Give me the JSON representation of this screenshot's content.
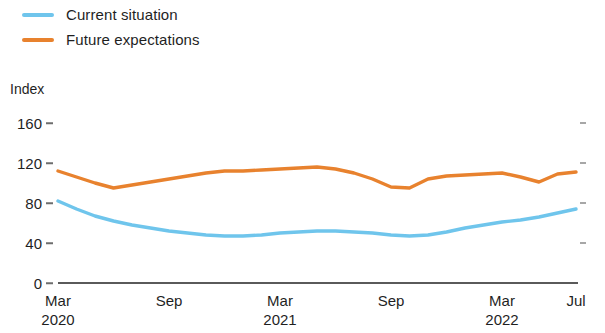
{
  "legend": {
    "position": "top-left",
    "entries": [
      {
        "label": "Current situation",
        "color": "#6FC5EC"
      },
      {
        "label": "Future expectations",
        "color": "#E8822E"
      }
    ]
  },
  "axis_title": "Index",
  "yticks": [
    {
      "label": "0"
    },
    {
      "label": "40"
    },
    {
      "label": "80"
    },
    {
      "label": "120"
    },
    {
      "label": "160"
    }
  ],
  "xticks": [
    {
      "label": "Mar",
      "year": "2020"
    },
    {
      "label": "Sep",
      "year": ""
    },
    {
      "label": "Mar",
      "year": "2021"
    },
    {
      "label": "Sep",
      "year": ""
    },
    {
      "label": "Mar",
      "year": "2022"
    },
    {
      "label": "Jul",
      "year": ""
    }
  ],
  "chart_data": {
    "type": "line",
    "title": "",
    "subtitle": "",
    "xlabel": "",
    "ylabel": "Index",
    "ylim": [
      0,
      160
    ],
    "yticks": [
      0,
      40,
      80,
      120,
      160
    ],
    "grid": false,
    "legend_position": "top-left",
    "x": [
      "Mar 2020",
      "Apr 2020",
      "May 2020",
      "Jun 2020",
      "Jul 2020",
      "Aug 2020",
      "Sep 2020",
      "Oct 2020",
      "Nov 2020",
      "Dec 2020",
      "Jan 2021",
      "Feb 2021",
      "Mar 2021",
      "Apr 2021",
      "May 2021",
      "Jun 2021",
      "Jul 2021",
      "Aug 2021",
      "Sep 2021",
      "Oct 2021",
      "Nov 2021",
      "Dec 2021",
      "Jan 2022",
      "Feb 2022",
      "Mar 2022",
      "Apr 2022",
      "May 2022",
      "Jun 2022",
      "Jul 2022"
    ],
    "x_tick_labels": [
      "Mar 2020",
      "Sep",
      "Mar 2021",
      "Sep",
      "Mar 2022",
      "Jul"
    ],
    "series": [
      {
        "name": "Current situation",
        "color": "#6FC5EC",
        "values": [
          82,
          74,
          67,
          62,
          58,
          55,
          52,
          50,
          48,
          47,
          47,
          48,
          50,
          51,
          52,
          52,
          51,
          50,
          48,
          47,
          48,
          51,
          55,
          58,
          61,
          63,
          66,
          70,
          74
        ]
      },
      {
        "name": "Future expectations",
        "color": "#E8822E",
        "values": [
          112,
          106,
          100,
          95,
          98,
          101,
          104,
          107,
          110,
          112,
          112,
          113,
          114,
          115,
          116,
          114,
          110,
          104,
          96,
          95,
          104,
          107,
          108,
          109,
          110,
          106,
          101,
          109,
          111
        ]
      }
    ]
  },
  "plot_geometry": {
    "left": 58,
    "right": 576,
    "y_zero": 283,
    "y_per_unit": 1.0
  }
}
